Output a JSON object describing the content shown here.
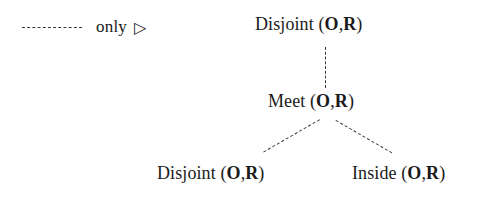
{
  "diagram": {
    "background_color": "#ffffff",
    "ink_color": "#1a1a1a",
    "edge_color": "#3a3a3a",
    "edge_style": "dashed"
  },
  "legend": {
    "line_style_label": "dashed-line-sample",
    "label": "only",
    "glyph": "▷",
    "glyph_name": "right-pointing-triangle"
  },
  "tree": {
    "root": {
      "relation": "Disjoint",
      "open_paren": " (",
      "arg1": "O",
      "comma": ",",
      "arg2": "R",
      "close_paren": ")"
    },
    "middle": {
      "relation": "Meet",
      "open_paren": " (",
      "arg1": "O",
      "comma": ",",
      "arg2": "R",
      "close_paren": ")"
    },
    "leaf_left": {
      "relation": "Disjoint",
      "open_paren": " (",
      "arg1": "O",
      "comma": ",",
      "arg2": "R",
      "close_paren": ")"
    },
    "leaf_right": {
      "relation": "Inside",
      "open_paren": " (",
      "arg1": "O",
      "comma": ",",
      "arg2": "R",
      "close_paren": ")"
    }
  }
}
